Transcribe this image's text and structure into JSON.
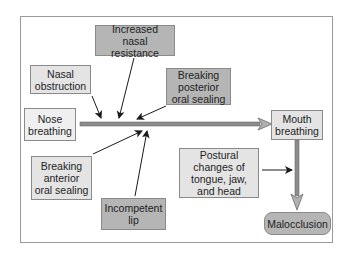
{
  "diagram": {
    "nodes": {
      "increased_nasal_resistance": "Increased nasal resistance",
      "nasal_obstruction": "Nasal obstruction",
      "breaking_posterior_oral_sealing": "Breaking posterior oral sealing",
      "nose_breathing": "Nose breathing",
      "mouth_breathing": "Mouth breathing",
      "breaking_anterior_oral_sealing": "Breaking anterior oral sealing",
      "incompetent_lip": "Incompetent lip",
      "postural_changes": "Postural changes of tongue, jaw, and head",
      "malocclusion": "Malocclusion"
    },
    "edges": [
      {
        "from": "nose_breathing",
        "to": "mouth_breathing",
        "style": "thick-gray"
      },
      {
        "from": "nasal_obstruction",
        "to": "nose_breathing_to_mouth_breathing"
      },
      {
        "from": "increased_nasal_resistance",
        "to": "nose_breathing_to_mouth_breathing"
      },
      {
        "from": "breaking_posterior_oral_sealing",
        "to": "nose_breathing_to_mouth_breathing"
      },
      {
        "from": "breaking_anterior_oral_sealing",
        "to": "nose_breathing_to_mouth_breathing"
      },
      {
        "from": "incompetent_lip",
        "to": "nose_breathing_to_mouth_breathing"
      },
      {
        "from": "mouth_breathing",
        "to": "malocclusion",
        "style": "thick-gray"
      },
      {
        "from": "postural_changes",
        "to": "mouth_breathing_to_malocclusion"
      }
    ],
    "colors": {
      "medium_fill": "#b5b5b5",
      "light_fill": "#e4e4e4",
      "thick_arrow": "#8c8c8c",
      "border": "#8a8a8a"
    }
  }
}
